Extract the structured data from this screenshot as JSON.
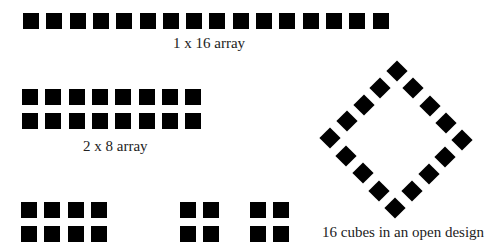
{
  "figure": {
    "cube_color": "#000000",
    "arrangements": [
      {
        "id": "row-1x16",
        "rows": 1,
        "cols": 16,
        "caption": "1 x 16 array"
      },
      {
        "id": "array-2x8",
        "rows": 2,
        "cols": 8,
        "caption": "2 x 8 array"
      },
      {
        "id": "array-2x4",
        "rows": 2,
        "cols": 4,
        "caption": ""
      },
      {
        "id": "array-2x2-a",
        "rows": 2,
        "cols": 2,
        "caption": ""
      },
      {
        "id": "array-2x2-b",
        "rows": 2,
        "cols": 2,
        "caption": ""
      },
      {
        "id": "open-diamond",
        "shape": "diamond",
        "count": 16,
        "per_side_steps": 4,
        "caption": "16 cubes in an open design"
      }
    ]
  }
}
